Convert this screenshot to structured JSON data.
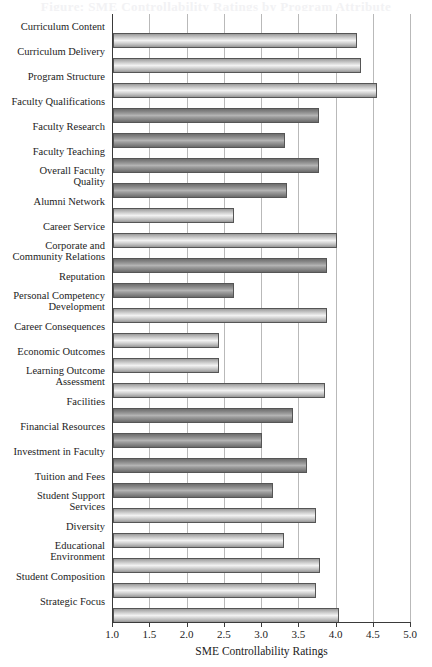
{
  "chart_data": {
    "type": "bar",
    "orientation": "horizontal",
    "title": "",
    "xlabel": "SME Controllability Ratings",
    "ylabel": "",
    "xlim": [
      1.0,
      5.0
    ],
    "xticks": [
      "1.0",
      "1.5",
      "2.0",
      "2.5",
      "3.0",
      "3.5",
      "4.0",
      "4.5",
      "5.0"
    ],
    "xtick_values": [
      1.0,
      1.5,
      2.0,
      2.5,
      3.0,
      3.5,
      4.0,
      4.5,
      5.0
    ],
    "grid": "vertical",
    "legend": "none",
    "categories": [
      "Curriculum Content",
      "Curriculum Delivery",
      "Program Structure",
      "Faculty Qualifications",
      "Faculty Research",
      "Faculty Teaching",
      "Overall Faculty\nQuality",
      "Alumni Network",
      "Career Service",
      "Corporate and\nCommunity Relations",
      "Reputation",
      "Personal Competency\nDevelopment",
      "Career Consequences",
      "Economic Outcomes",
      "Learning Outcome\nAssessment",
      "Facilities",
      "Financial Resources",
      "Investment in Faculty",
      "Tuition and Fees",
      "Student Support\nServices",
      "Diversity",
      "Educational\nEnvironment",
      "Student Composition",
      "Strategic Focus"
    ],
    "values": [
      4.27,
      4.33,
      4.55,
      3.76,
      3.31,
      3.76,
      3.33,
      2.63,
      4.0,
      3.87,
      2.63,
      3.87,
      2.42,
      2.42,
      3.85,
      3.42,
      3.0,
      3.6,
      3.15,
      3.72,
      3.3,
      3.78,
      3.72,
      4.03
    ],
    "bar_shades": [
      "light",
      "light",
      "light",
      "dark",
      "dark",
      "dark",
      "dark",
      "light",
      "light",
      "dark",
      "dark",
      "light",
      "light",
      "light",
      "light",
      "dark",
      "dark",
      "dark",
      "dark",
      "light",
      "light",
      "light",
      "light",
      "light"
    ]
  },
  "axis_title_remnant": "Figure: SME Controllability Ratings by Program Attribute"
}
